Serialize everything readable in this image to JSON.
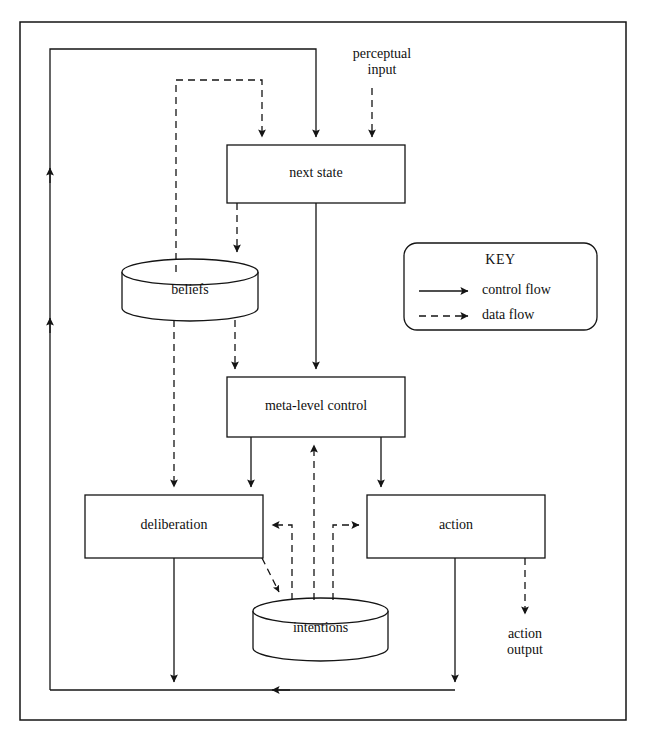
{
  "figure": {
    "type": "flow-diagram",
    "title": "",
    "outer_frame": {
      "present": true
    }
  },
  "nodes": {
    "next_state": {
      "label": "next state",
      "shape": "rectangle"
    },
    "beliefs": {
      "label": "beliefs",
      "shape": "cylinder"
    },
    "meta_level_control": {
      "label": "meta-level control",
      "shape": "rectangle"
    },
    "deliberation": {
      "label": "deliberation",
      "shape": "rectangle"
    },
    "action": {
      "label": "action",
      "shape": "rectangle"
    },
    "intentions": {
      "label": "intentions",
      "shape": "cylinder"
    }
  },
  "free_labels": {
    "perceptual_input": "perceptual\ninput",
    "action_output": "action\noutput"
  },
  "key": {
    "title": "KEY",
    "items": [
      {
        "label": "control flow",
        "style": "solid"
      },
      {
        "label": "data flow",
        "style": "dashed"
      }
    ]
  },
  "colors": {
    "ink": "#141414",
    "background": "#ffffff"
  },
  "edges": [
    {
      "from": "perceptual input",
      "to": "next state",
      "style": "dashed"
    },
    {
      "from": "feedback loop",
      "to": "next state",
      "style": "solid"
    },
    {
      "from": "beliefs loop",
      "to": "next state",
      "style": "dashed"
    },
    {
      "from": "next state",
      "to": "beliefs",
      "style": "dashed"
    },
    {
      "from": "next state",
      "to": "meta-level control",
      "style": "solid"
    },
    {
      "from": "beliefs",
      "to": "meta-level control",
      "style": "dashed"
    },
    {
      "from": "beliefs",
      "to": "deliberation",
      "style": "dashed"
    },
    {
      "from": "meta-level control",
      "to": "deliberation",
      "style": "solid"
    },
    {
      "from": "meta-level control",
      "to": "action",
      "style": "solid"
    },
    {
      "from": "intentions",
      "to": "meta-level control",
      "style": "dashed"
    },
    {
      "from": "intentions",
      "to": "deliberation",
      "style": "dashed"
    },
    {
      "from": "intentions",
      "to": "action",
      "style": "dashed"
    },
    {
      "from": "deliberation",
      "to": "intentions",
      "style": "dashed"
    },
    {
      "from": "deliberation",
      "to": "feedback loop",
      "style": "solid"
    },
    {
      "from": "action",
      "to": "feedback loop",
      "style": "solid"
    },
    {
      "from": "action",
      "to": "action output",
      "style": "dashed"
    }
  ]
}
